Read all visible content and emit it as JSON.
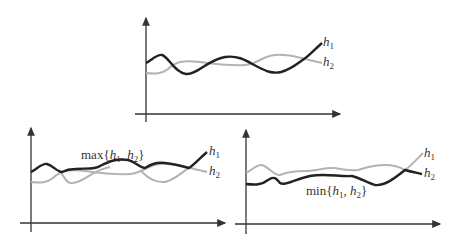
{
  "figure": {
    "panels": [
      {
        "id": "top",
        "description": "Two functions h1 and h2",
        "labels": {
          "h1": "h",
          "h1_sub": "1",
          "h2": "h",
          "h2_sub": "2"
        }
      },
      {
        "id": "bottom-left",
        "description": "Upper envelope",
        "annotation": {
          "prefix": "max{",
          "h1": "h",
          "h1_sub": "1",
          "sep": ", ",
          "h2": "h",
          "h2_sub": "2",
          "suffix": "}"
        },
        "labels": {
          "h1": "h",
          "h1_sub": "1",
          "h2": "h",
          "h2_sub": "2"
        }
      },
      {
        "id": "bottom-right",
        "description": "Lower envelope",
        "annotation": {
          "prefix": "min{",
          "h1": "h",
          "h1_sub": "1",
          "sep": ", ",
          "h2": "h",
          "h2_sub": "2",
          "suffix": "}"
        },
        "labels": {
          "h1": "h",
          "h1_sub": "1",
          "h2": "h",
          "h2_sub": "2"
        }
      }
    ],
    "colors": {
      "dark": "#222222",
      "light": "#b3b3b3",
      "axis": "#333333"
    }
  }
}
